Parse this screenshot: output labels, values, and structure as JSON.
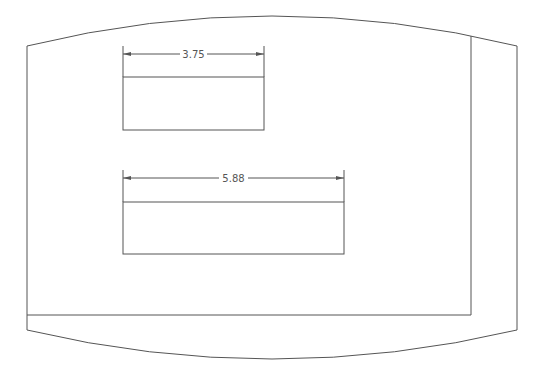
{
  "drawing": {
    "line_color": "#555555",
    "background": "#ffffff",
    "outline": {
      "left_x": 27,
      "right_x": 517,
      "top_corner_y": 46,
      "top_peak_y": 16,
      "bottom_corner_y": 330,
      "bottom_trough_y": 359,
      "inner_vertical_x": 471,
      "inner_horizontal_y": 315
    },
    "dimensions": [
      {
        "label": "3.75",
        "x1": 123,
        "x2": 264,
        "dim_y": 54,
        "ext_top": 46,
        "ext_bottom": 77
      },
      {
        "label": "5.88",
        "x1": 123,
        "x2": 344,
        "dim_y": 178,
        "ext_top": 170,
        "ext_bottom": 202
      }
    ],
    "rectangles": [
      {
        "name": "upper-rectangle",
        "x": 123,
        "y": 77,
        "w": 141,
        "h": 53
      },
      {
        "name": "lower-rectangle",
        "x": 123,
        "y": 202,
        "w": 221,
        "h": 52
      }
    ]
  }
}
